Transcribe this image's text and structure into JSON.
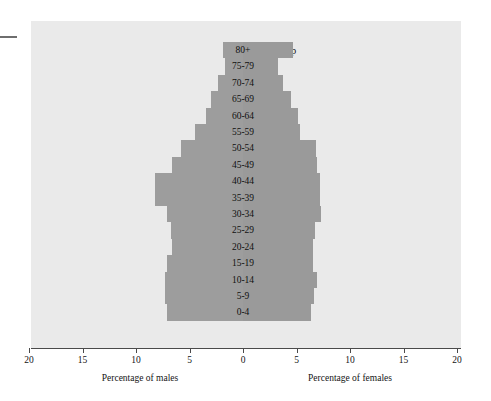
{
  "chart_data": {
    "type": "bar",
    "subtype": "population-pyramid",
    "title": "Age group",
    "xlabel_left": "Percentage of males",
    "xlabel_right": "Percentage of females",
    "ylabel": "",
    "grid": false,
    "legend": "none",
    "xlim": [
      -20,
      20
    ],
    "xticks": [
      20,
      15,
      10,
      5,
      0,
      5,
      10,
      15,
      20
    ],
    "xtick_labels": [
      "20",
      "15",
      "10",
      "5",
      "0",
      "5",
      "10",
      "15",
      "20"
    ],
    "categories": [
      "80+",
      "75-79",
      "70-74",
      "65-69",
      "60-64",
      "55-59",
      "50-54",
      "45-49",
      "40-44",
      "35-39",
      "30-34",
      "25-29",
      "20-24",
      "15-19",
      "10-14",
      "5-9",
      "0-4"
    ],
    "series": [
      {
        "name": "Percentage of males",
        "side": "left",
        "values": [
          1.9,
          1.7,
          2.3,
          3.0,
          3.5,
          4.5,
          5.8,
          6.6,
          8.2,
          8.2,
          7.1,
          6.7,
          6.6,
          7.1,
          7.3,
          7.3,
          7.1
        ]
      },
      {
        "name": "Percentage of females",
        "side": "right",
        "values": [
          4.7,
          3.3,
          3.7,
          4.5,
          5.1,
          5.3,
          6.8,
          6.9,
          7.2,
          7.2,
          7.3,
          6.7,
          6.5,
          6.5,
          6.9,
          6.6,
          6.4
        ]
      }
    ],
    "colors": {
      "bar": "#9d9d9d",
      "plot_background": "#eaeaea",
      "axis": "#4a4a4a",
      "text": "#141414"
    }
  }
}
